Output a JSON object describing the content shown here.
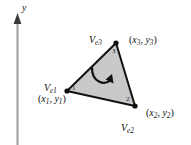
{
  "figure": {
    "background_color": "#ffffff",
    "element_fill_color": "#c9c9c9",
    "element_stroke_color": "#111111",
    "axis_color": "#9a9a9a",
    "axis": {
      "y_label": "y",
      "y_label_name": "y-axis-label",
      "direction": "up"
    },
    "orientation_arrow": {
      "name": "counterclockwise-orientation-arrow",
      "direction": "counterclockwise"
    },
    "vertices": [
      {
        "local_number": "1",
        "name_prefix": "V",
        "name_subscript": "e1",
        "coord_open": "(",
        "coord_x": "x",
        "coord_x_sub": "1",
        "coord_comma": ",",
        "coord_y": "y",
        "coord_y_sub": "1",
        "coord_close": ")",
        "px": 67,
        "py": 91
      },
      {
        "local_number": "2",
        "name_prefix": "V",
        "name_subscript": "e2",
        "coord_open": "(",
        "coord_x": "x",
        "coord_x_sub": "2",
        "coord_comma": ",",
        "coord_y": "y",
        "coord_y_sub": "2",
        "coord_close": ")",
        "px": 135,
        "py": 106
      },
      {
        "local_number": "3",
        "name_prefix": "V",
        "name_subscript": "e3",
        "coord_open": "(",
        "coord_x": "x",
        "coord_x_sub": "3",
        "coord_comma": ",",
        "coord_y": "y",
        "coord_y_sub": "3",
        "coord_close": ")",
        "px": 116,
        "py": 43
      }
    ]
  }
}
